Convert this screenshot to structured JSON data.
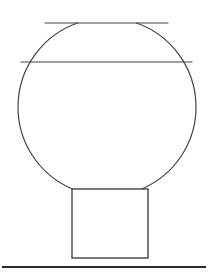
{
  "canvas": {
    "width": 208,
    "height": 273,
    "background_color": "#ffffff"
  },
  "figure": {
    "title": "",
    "stroke_color": "#444444",
    "fill_color": "none",
    "ground_color": "#2b2b2b"
  },
  "shapes": {
    "body": {
      "name": "vessel-body",
      "type": "truncated-circle",
      "center_x": 107,
      "center_y": 107,
      "radius": 89,
      "top_cut_y": 23,
      "bottom_cut_y": 189,
      "stroke_width": 1.2
    },
    "top_chord": {
      "name": "vessel-top-opening",
      "type": "line",
      "x1": 45,
      "y1": 23,
      "x2": 168,
      "y2": 23,
      "stroke_width": 1.2
    },
    "fill_line": {
      "name": "fill-level-line",
      "type": "line",
      "x1": 21,
      "y1": 62,
      "x2": 192,
      "y2": 62,
      "stroke_width": 1.2
    },
    "base": {
      "name": "square-base",
      "type": "rect",
      "x": 72,
      "y": 189,
      "width": 76,
      "height": 69,
      "stroke_width": 1.4
    },
    "ground": {
      "name": "ground-line",
      "type": "line",
      "x1": 2,
      "y1": 267,
      "x2": 206,
      "y2": 267,
      "stroke_width": 2.2
    }
  }
}
